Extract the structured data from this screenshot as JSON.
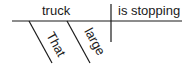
{
  "diagram": {
    "type": "sentence-diagram",
    "subject": "truck",
    "predicate": "is stopping",
    "modifiers": [
      "That",
      "large"
    ]
  }
}
